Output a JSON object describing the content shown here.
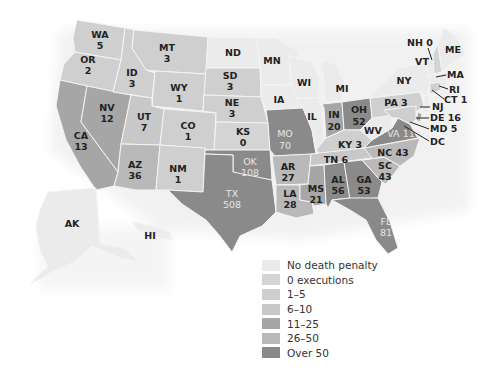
{
  "map": {
    "title": "",
    "legend": [
      {
        "key": "none",
        "label": "No death penalty",
        "color": "#ebebeb"
      },
      {
        "key": "zero",
        "label": "0 executions",
        "color": "#d4d4d4"
      },
      {
        "key": "1_5",
        "label": "1–5",
        "color": "#cfcfcf"
      },
      {
        "key": "6_10",
        "label": "6–10",
        "color": "#c8c8c8"
      },
      {
        "key": "11_25",
        "label": "11–25",
        "color": "#a6a6a6"
      },
      {
        "key": "26_50",
        "label": "26–50",
        "color": "#b9b9b9"
      },
      {
        "key": "over50",
        "label": "Over 50",
        "color": "#8a8a8a"
      }
    ],
    "states": [
      {
        "abbr": "WA",
        "value": "5",
        "category": "1_5"
      },
      {
        "abbr": "OR",
        "value": "2",
        "category": "1_5"
      },
      {
        "abbr": "CA",
        "value": "13",
        "category": "11_25"
      },
      {
        "abbr": "NV",
        "value": "12",
        "category": "11_25"
      },
      {
        "abbr": "ID",
        "value": "3",
        "category": "1_5"
      },
      {
        "abbr": "MT",
        "value": "3",
        "category": "1_5"
      },
      {
        "abbr": "WY",
        "value": "1",
        "category": "1_5"
      },
      {
        "abbr": "UT",
        "value": "7",
        "category": "6_10"
      },
      {
        "abbr": "AZ",
        "value": "36",
        "category": "26_50"
      },
      {
        "abbr": "CO",
        "value": "1",
        "category": "1_5"
      },
      {
        "abbr": "NM",
        "value": "1",
        "category": "1_5"
      },
      {
        "abbr": "ND",
        "value": "",
        "category": "none"
      },
      {
        "abbr": "SD",
        "value": "3",
        "category": "1_5"
      },
      {
        "abbr": "NE",
        "value": "3",
        "category": "1_5"
      },
      {
        "abbr": "KS",
        "value": "0",
        "category": "zero"
      },
      {
        "abbr": "OK",
        "value": "108",
        "category": "over50"
      },
      {
        "abbr": "TX",
        "value": "508",
        "category": "over50"
      },
      {
        "abbr": "MN",
        "value": "",
        "category": "none"
      },
      {
        "abbr": "IA",
        "value": "",
        "category": "none"
      },
      {
        "abbr": "MO",
        "value": "70",
        "category": "over50"
      },
      {
        "abbr": "AR",
        "value": "27",
        "category": "26_50"
      },
      {
        "abbr": "LA",
        "value": "28",
        "category": "26_50"
      },
      {
        "abbr": "WI",
        "value": "",
        "category": "none"
      },
      {
        "abbr": "IL",
        "value": "",
        "category": "none"
      },
      {
        "abbr": "MI",
        "value": "",
        "category": "none"
      },
      {
        "abbr": "IN",
        "value": "20",
        "category": "11_25"
      },
      {
        "abbr": "OH",
        "value": "52",
        "category": "over50"
      },
      {
        "abbr": "KY",
        "value": "3",
        "category": "1_5"
      },
      {
        "abbr": "TN",
        "value": "6",
        "category": "6_10"
      },
      {
        "abbr": "MS",
        "value": "21",
        "category": "11_25"
      },
      {
        "abbr": "AL",
        "value": "56",
        "category": "over50"
      },
      {
        "abbr": "GA",
        "value": "53",
        "category": "over50"
      },
      {
        "abbr": "FL",
        "value": "81",
        "category": "over50"
      },
      {
        "abbr": "SC",
        "value": "43",
        "category": "26_50"
      },
      {
        "abbr": "NC",
        "value": "43",
        "category": "26_50"
      },
      {
        "abbr": "VA",
        "value": "110",
        "category": "over50"
      },
      {
        "abbr": "WV",
        "value": "",
        "category": "none"
      },
      {
        "abbr": "PA",
        "value": "3",
        "category": "1_5"
      },
      {
        "abbr": "NY",
        "value": "",
        "category": "none"
      },
      {
        "abbr": "VT",
        "value": "",
        "category": "none"
      },
      {
        "abbr": "NH",
        "value": "0",
        "category": "zero"
      },
      {
        "abbr": "ME",
        "value": "",
        "category": "none"
      },
      {
        "abbr": "MA",
        "value": "",
        "category": "none"
      },
      {
        "abbr": "RI",
        "value": "",
        "category": "none"
      },
      {
        "abbr": "CT",
        "value": "1",
        "category": "1_5"
      },
      {
        "abbr": "NJ",
        "value": "",
        "category": "none"
      },
      {
        "abbr": "DE",
        "value": "16",
        "category": "11_25"
      },
      {
        "abbr": "MD",
        "value": "5",
        "category": "1_5"
      },
      {
        "abbr": "DC",
        "value": "",
        "category": "none"
      },
      {
        "abbr": "AK",
        "value": "",
        "category": "none"
      },
      {
        "abbr": "HI",
        "value": "",
        "category": "none"
      }
    ]
  },
  "labels": {
    "WA": "WA",
    "WA_v": "5",
    "OR": "OR",
    "OR_v": "2",
    "CA": "CA",
    "CA_v": "13",
    "NV": "NV",
    "NV_v": "12",
    "ID": "ID",
    "ID_v": "3",
    "MT": "MT",
    "MT_v": "3",
    "WY": "WY",
    "WY_v": "1",
    "UT": "UT",
    "UT_v": "7",
    "AZ": "AZ",
    "AZ_v": "36",
    "CO": "CO",
    "CO_v": "1",
    "NM": "NM",
    "NM_v": "1",
    "ND": "ND",
    "SD": "SD",
    "SD_v": "3",
    "NE": "NE",
    "NE_v": "3",
    "KS": "KS",
    "KS_v": "0",
    "OK": "OK",
    "OK_v": "108",
    "TX": "TX",
    "TX_v": "508",
    "MN": "MN",
    "IA": "IA",
    "MO": "MO",
    "MO_v": "70",
    "AR": "AR",
    "AR_v": "27",
    "LA": "LA",
    "LA_v": "28",
    "WI": "WI",
    "IL": "IL",
    "MI": "MI",
    "IN": "IN",
    "IN_v": "20",
    "OH": "OH",
    "OH_v": "52",
    "KY": "KY 3",
    "TN": "TN 6",
    "MS": "MS",
    "MS_v": "21",
    "AL": "AL",
    "AL_v": "56",
    "GA": "GA",
    "GA_v": "53",
    "FL": "FL",
    "FL_v": "81",
    "SC": "SC",
    "SC_v": "43",
    "NC": "NC 43",
    "VA": "VA 110",
    "WV": "WV",
    "PA": "PA  3",
    "NY": "NY",
    "VT": "VT",
    "NH": "NH 0",
    "ME": "ME",
    "MA": "MA",
    "RI": "RI",
    "CT": "CT 1",
    "NJ": "NJ",
    "DE": "DE 16",
    "MD": "MD 5",
    "DC": "DC",
    "AK": "AK",
    "HI": "HI"
  }
}
